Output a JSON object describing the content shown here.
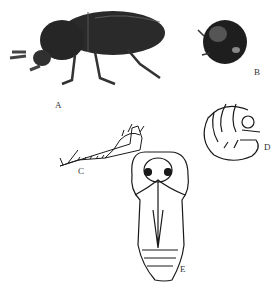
{
  "figure": {
    "panels": [
      {
        "id": "A",
        "label": "A",
        "subject": "adult beetle, lateral view"
      },
      {
        "id": "B",
        "label": "B",
        "subject": "adult beetle, head-on view"
      },
      {
        "id": "C",
        "label": "C",
        "subject": "leg / appendage detail"
      },
      {
        "id": "D",
        "label": "D",
        "subject": "larva (curled grub)"
      },
      {
        "id": "E",
        "label": "E",
        "subject": "pupa, ventral view"
      }
    ],
    "colors": {
      "ink": "#1a1a1a",
      "beetle_body": "#2a2a2a",
      "background": "#ffffff"
    }
  }
}
